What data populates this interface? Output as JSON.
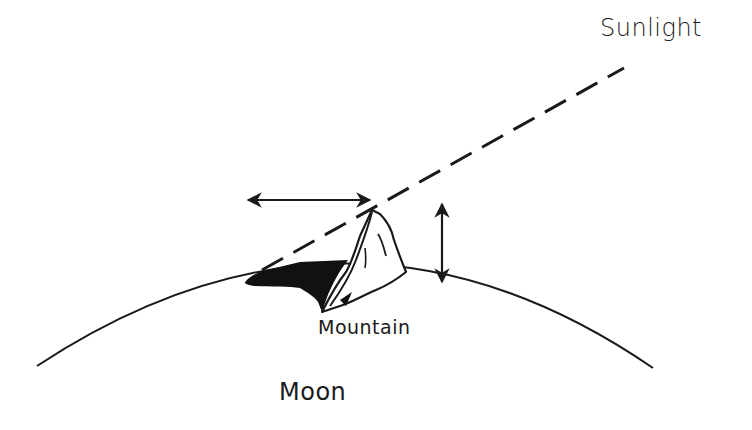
{
  "diagram": {
    "labels": {
      "sunlight": "Sunlight",
      "mountain": "Mountain",
      "moon": "Moon"
    },
    "elements": {
      "moon_surface": "curved arc representing Moon's limb",
      "sunlight_ray": "dashed line grazing mountain peak",
      "shadow": "black shadow cast to the left of mountain",
      "shadow_length_arrow": "horizontal double-headed arrow",
      "height_arrow": "vertical double-headed arrow"
    },
    "colors": {
      "ink": "#1a1a1a",
      "background": "#ffffff"
    }
  }
}
